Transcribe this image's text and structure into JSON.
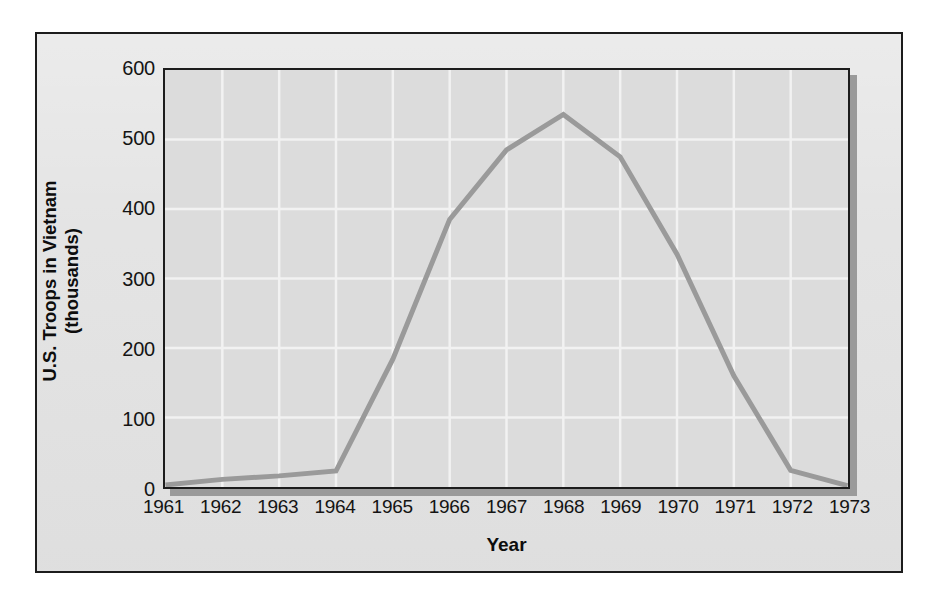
{
  "figure": {
    "background_color": "#ffffff",
    "card_background_color": "#e3e3e3",
    "plot_background_color": "#dcdcdc",
    "frame_color": "#1c1c1c"
  },
  "chart_data": {
    "type": "line",
    "title": "",
    "subtitle": "",
    "xlabel": "Year",
    "ylabel_line1": "U.S. Troops in Vietnam",
    "ylabel_line2": "(thousands)",
    "ylabel": "U.S. Troops in Vietnam (thousands)",
    "categories": [
      "1961",
      "1962",
      "1963",
      "1964",
      "1965",
      "1966",
      "1967",
      "1968",
      "1969",
      "1970",
      "1971",
      "1972",
      "1973"
    ],
    "x": [
      1961,
      1962,
      1963,
      1964,
      1965,
      1966,
      1967,
      1968,
      1969,
      1970,
      1971,
      1972,
      1973
    ],
    "values": [
      3,
      11,
      16,
      23,
      184,
      385,
      485,
      536,
      475,
      335,
      160,
      24,
      2
    ],
    "series": [
      {
        "name": "U.S. Troops in Vietnam",
        "color": "#9a9a9a",
        "line_width": 5,
        "values": [
          3,
          11,
          16,
          23,
          184,
          385,
          485,
          536,
          475,
          335,
          160,
          24,
          2
        ]
      }
    ],
    "xtick_labels": [
      "1961",
      "1962",
      "1963",
      "1964",
      "1965",
      "1966",
      "1967",
      "1968",
      "1969",
      "1970",
      "1971",
      "1972",
      "1973"
    ],
    "ytick_labels": [
      "0",
      "100",
      "200",
      "300",
      "400",
      "500",
      "600"
    ],
    "ytick_values": [
      0,
      100,
      200,
      300,
      400,
      500,
      600
    ],
    "ylim": [
      0,
      600
    ],
    "xlim": [
      1961,
      1973
    ],
    "grid": true,
    "grid_color": "#f2f2f2",
    "legend": false,
    "legend_position": "none",
    "annotations": []
  }
}
